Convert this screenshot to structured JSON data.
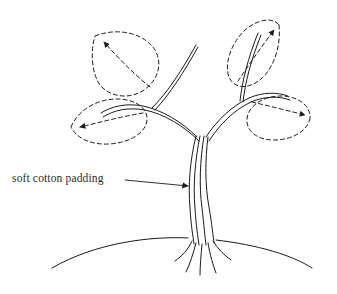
{
  "diagram": {
    "background_color": "#ffffff",
    "stroke_color": "#1a1a1a",
    "annotation": {
      "label": "soft cotton padding",
      "text_color": "#2b2b2b",
      "leader_line": {
        "from_x": 125,
        "from_y": 181,
        "to_x": 190,
        "to_y": 186,
        "arrowhead": "solid-triangle"
      }
    },
    "ground": {
      "type": "arc",
      "left_x": 52,
      "right_x": 312,
      "peak_x": 190,
      "peak_y": 238,
      "end_y": 268
    },
    "stem": {
      "style": "bundle-of-parallel-lines",
      "line_count": 4,
      "top_y": 135,
      "base_y": 245,
      "left_x": 190,
      "right_x": 214
    },
    "roots": {
      "count": 5,
      "splay": "fan-downward"
    },
    "branches": [
      {
        "name": "left-branch",
        "direction": "up-left",
        "style": "double-line"
      },
      {
        "name": "right-branch",
        "direction": "up-right",
        "style": "double-line"
      }
    ],
    "leaves": [
      {
        "name": "upper-left-leaf",
        "outline": "dashed",
        "tip_x": 92,
        "tip_y": 33,
        "arrowhead": true,
        "midrib": "dashed"
      },
      {
        "name": "lower-left-leaf",
        "outline": "dashed",
        "tip_x": 68,
        "tip_y": 128,
        "arrowhead": true,
        "midrib": "dashed"
      },
      {
        "name": "upper-right-leaf",
        "outline": "dashed",
        "tip_x": 281,
        "tip_y": 21,
        "arrowhead": true,
        "midrib": "dashed"
      },
      {
        "name": "lower-right-leaf",
        "outline": "dashed",
        "tip_x": 313,
        "tip_y": 117,
        "arrowhead": true,
        "midrib": "dashed"
      }
    ]
  }
}
